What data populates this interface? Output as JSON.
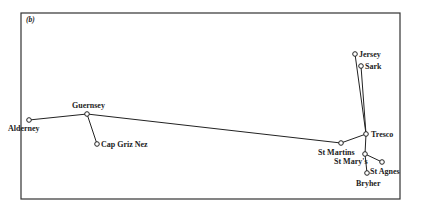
{
  "panel_label": "(b)",
  "frame": {
    "x": 21,
    "y": 13,
    "w": 379,
    "h": 186,
    "stroke": "#333333"
  },
  "nodes": [
    {
      "id": "alderney",
      "label": "Alderney",
      "x": 29,
      "y": 120,
      "lx": 8,
      "ly": 131
    },
    {
      "id": "guernsey",
      "label": "Guernsey",
      "x": 87,
      "y": 114,
      "lx": 72,
      "ly": 108
    },
    {
      "id": "cap-griz-nez",
      "label": "Cap Griz Nez",
      "x": 97,
      "y": 144,
      "lx": 101,
      "ly": 147
    },
    {
      "id": "st-martins",
      "label": "St Martins",
      "x": 341,
      "y": 143,
      "lx": 318,
      "ly": 155
    },
    {
      "id": "tresco",
      "label": "Tresco",
      "x": 366,
      "y": 134,
      "lx": 371,
      "ly": 137
    },
    {
      "id": "jersey",
      "label": "Jersey",
      "x": 355,
      "y": 54,
      "lx": 359,
      "ly": 57
    },
    {
      "id": "sark",
      "label": "Sark",
      "x": 361,
      "y": 66,
      "lx": 365,
      "ly": 69
    },
    {
      "id": "st-marys",
      "label": "St Mary's",
      "x": 365,
      "y": 154,
      "lx": 334,
      "ly": 164
    },
    {
      "id": "st-agnes",
      "label": "St Agnes",
      "x": 382,
      "y": 162,
      "lx": 370,
      "ly": 174
    },
    {
      "id": "bryher",
      "label": "Bryher",
      "x": 367,
      "y": 173,
      "lx": 356,
      "ly": 186
    }
  ],
  "edges": [
    [
      "alderney",
      "guernsey"
    ],
    [
      "guernsey",
      "cap-griz-nez"
    ],
    [
      "guernsey",
      "st-martins"
    ],
    [
      "st-martins",
      "tresco"
    ],
    [
      "tresco",
      "jersey"
    ],
    [
      "tresco",
      "sark"
    ],
    [
      "tresco",
      "st-marys"
    ],
    [
      "st-marys",
      "bryher"
    ],
    [
      "st-marys",
      "st-agnes"
    ]
  ]
}
